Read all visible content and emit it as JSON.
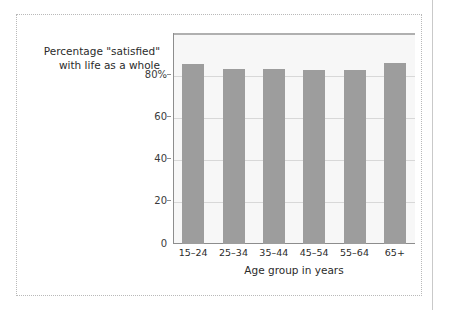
{
  "chart_data": {
    "type": "bar",
    "title": "Percentage \"satisfied\"\nwith life as a whole",
    "xlabel": "Age group in years",
    "ylabel": "",
    "categories": [
      "15–24",
      "25–34",
      "35–44",
      "45–54",
      "55–64",
      "65+"
    ],
    "values": [
      81,
      79,
      79,
      78.5,
      78.5,
      81.5
    ],
    "ylim": [
      0,
      95
    ],
    "yticks": [
      0,
      20,
      40,
      60,
      80
    ],
    "ytick_labels": [
      "0",
      "20",
      "40",
      "60",
      "80%"
    ],
    "grid": true,
    "legend": "none",
    "series": [
      {
        "name": "Percentage satisfied with life as a whole",
        "values": [
          81,
          79,
          79,
          78.5,
          78.5,
          81.5
        ]
      }
    ],
    "colors": {
      "bar_fill": "#9d9d9d",
      "plot_background": "#f7f7f7",
      "gridline": "#d8d8d8",
      "axis": "#8d8d8d",
      "frame_border": "#b9b9b9",
      "text": "#2b2b2b"
    }
  },
  "figure": {
    "caption": "Percentage \"satisfied\"\nwith life as a whole",
    "x_axis_title": "Age group in years"
  }
}
